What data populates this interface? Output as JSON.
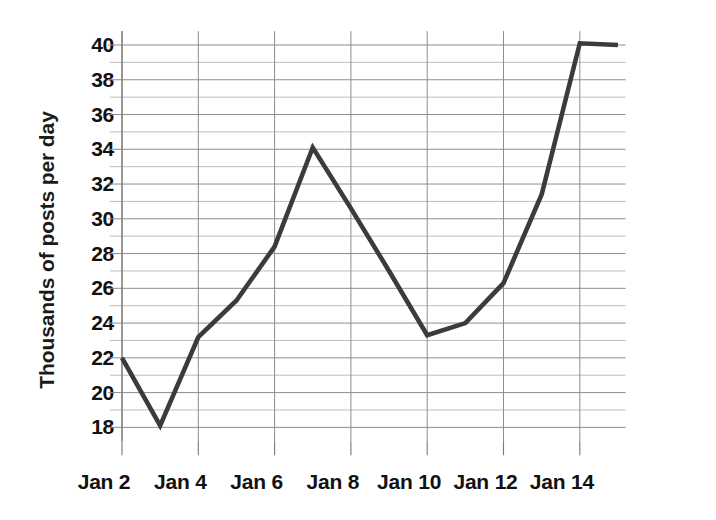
{
  "chart_data": {
    "type": "line",
    "title": "",
    "xlabel": "",
    "ylabel": "Thousands of posts per day",
    "x": [
      "Jan 2",
      "Jan 3",
      "Jan 4",
      "Jan 5",
      "Jan 6",
      "Jan 7",
      "Jan 8",
      "Jan 9",
      "Jan 10",
      "Jan 11",
      "Jan 12",
      "Jan 13",
      "Jan 14",
      "Jan 15"
    ],
    "values": [
      22.0,
      18.1,
      23.2,
      25.3,
      28.4,
      34.1,
      30.6,
      27.0,
      23.3,
      24.0,
      26.3,
      31.4,
      40.1,
      40.0
    ],
    "series": [
      {
        "name": "Posts per day",
        "values": [
          22.0,
          18.1,
          23.2,
          25.3,
          28.4,
          34.1,
          30.6,
          27.0,
          23.3,
          24.0,
          26.3,
          31.4,
          40.1,
          40.0
        ],
        "color": "#3b3b3b"
      }
    ],
    "xlim": [
      2,
      15
    ],
    "ylim": [
      17,
      40.8
    ],
    "y_major_ticks": [
      18,
      20,
      22,
      24,
      26,
      28,
      30,
      32,
      34,
      36,
      38,
      40
    ],
    "y_minor_ticks": [
      19,
      21,
      23,
      25,
      27,
      29,
      31,
      33,
      35,
      37,
      39
    ],
    "x_major_ticks": [
      2,
      4,
      6,
      8,
      10,
      12,
      14
    ],
    "x_tick_labels": [
      "Jan 2",
      "Jan 4",
      "Jan 6",
      "Jan 8",
      "Jan 10",
      "Jan 12",
      "Jan 14"
    ],
    "grid": true,
    "grid_axis": "both",
    "legend": false,
    "legend_position": "none",
    "line_color": "#3b3b3b",
    "grid_color_major": "#8d8d8d",
    "grid_color_minor": "#b6b6b6",
    "background": "#ffffff"
  },
  "axes": {
    "y_label": "Thousands of posts per day",
    "y_tick_labels": [
      "40",
      "38",
      "36",
      "34",
      "32",
      "30",
      "28",
      "26",
      "24",
      "22",
      "20",
      "18"
    ],
    "x_tick_labels": [
      "Jan 2",
      "Jan 4",
      "Jan 6",
      "Jan 8",
      "Jan 10",
      "Jan 12",
      "Jan 14"
    ]
  }
}
